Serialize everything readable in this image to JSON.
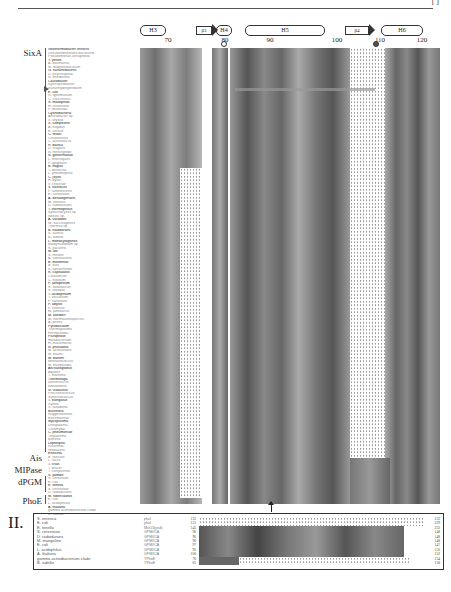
{
  "header": {
    "page_ref": "[ ]"
  },
  "secondary_structure": [
    {
      "type": "helix",
      "label": "H3"
    },
    {
      "type": "strand",
      "label": "β3"
    },
    {
      "type": "helix",
      "label": "H4"
    },
    {
      "type": "helix",
      "label": "H5"
    },
    {
      "type": "strand",
      "label": "β4"
    },
    {
      "type": "helix",
      "label": "H6"
    }
  ],
  "ruler": {
    "ticks": [
      "70",
      "80",
      "90",
      "100",
      "110",
      "120"
    ]
  },
  "groups": {
    "sixa": "SixA",
    "ais": "Ais",
    "mipase": "MIPase",
    "dpgm": "dPGM",
    "phoe": "PhoE"
  },
  "panel1": {
    "species": [
      "Geothermobacter ehrlichii",
      "Desulfovibrionales bacterium",
      "Pseudomonas aeruginosa",
      "Y. pestis",
      "A. baumannii",
      "M. magnetotacticum",
      "G. sulfurreducens",
      "D. psychrophila",
      "S. oneidensis",
      "Caulobacter",
      "Syntrophobacter",
      "Sulfurihydrogenibium",
      "E. coli",
      "S. typhimurium",
      "C. crescentus",
      "S. maltophilia",
      "H. influenzae",
      "P. multocida",
      "Cyanobacteria",
      "Arthrobacter sp.",
      "X. oryzae",
      "X. campestris",
      "A. fulgidus",
      "B. cereus",
      "C. tetani",
      "Chloroflexus",
      "C. aurantiacus",
      "R. baltica",
      "D. vulgaris",
      "N. meningitidis",
      "N. gonorrhoeae",
      "L. interrogans",
      "P. gingivalis",
      "B. fragilis",
      "T. denticola",
      "L. pneumophila",
      "C. jejuni",
      "H. pylori",
      "V. cholerae",
      "V. vulnificus",
      "P. luminescens",
      "E. carotovora",
      "A. dehalogenans",
      "M. xanthus",
      "D. radiodurans",
      "T. thermophilus",
      "Synechocystis sp.",
      "Nostoc sp.",
      "A. variabilis",
      "W. succinogenes",
      "Thermus sp.",
      "B. halodurans",
      "S. aureus",
      "B. subtilis",
      "L. monocytogenes",
      "Bradyrhizobium sp.",
      "R. palustris",
      "M. loti",
      "S. meliloti",
      "A. tumefaciens",
      "B. melitensis",
      "B. suis",
      "R. sphaeroides",
      "R. capsulatus",
      "Chlorobium",
      "C. tepidum",
      "P. aerophilum",
      "S. solfataricus",
      "S. tokodaii",
      "T. acidophilum",
      "T. volcanium",
      "P. horikoshii",
      "P. abyssi",
      "P. furiosus",
      "M. jannaschii",
      "M. kandleri",
      "M. thermautotrophicus",
      "A. pernix",
      "Pyrobaculum",
      "Thermoplasma",
      "Ferroplasma",
      "Picrophilus",
      "Halobacterium",
      "H. marismortui",
      "N. pharaonis",
      "M. acetivorans",
      "M. mazei",
      "M. barkeri",
      "Methanococcus",
      "M. maripaludis",
      "Archaeoglobus",
      "Aquifex",
      "T. maritima",
      "Thermotoga",
      "Deinococcus",
      "Bdellovibrio",
      "G. violaceus",
      "Prochlorococcus",
      "Synechococcus",
      "T. elongatus",
      "Xylella",
      "X. fastidiosa",
      "Buchnera",
      "Wigglesworthia",
      "Blochmannia",
      "Mycoplasma",
      "Ureaplasma",
      "Chlamydia",
      "C. pneumoniae",
      "Treponema",
      "Borrelia",
      "Leptospira",
      "Rickettsia",
      "Wolbachia",
      "Ehrlichia",
      "E. faecalis",
      "L. lactis",
      "T. cruzi",
      "T. brucei",
      "T. congolense",
      "S. pombe",
      "S. cerevisiae",
      "E. coli",
      "E. tenella",
      "S. cerevisiae",
      "D. radiodurans",
      "M. tuberculosis",
      "E. coli",
      "L. acidophilus",
      "A. thaliana",
      "gamma actinobacterium clade",
      "B. subtilis"
    ],
    "marker_row": "E. coli"
  },
  "panel2": {
    "label": "II.",
    "rows": [
      {
        "species": "S. enterica",
        "id": "phoI",
        "start": "132",
        "end": "232"
      },
      {
        "species": "E. coli",
        "id": "phoI",
        "start": "131",
        "end": "229"
      },
      {
        "species": "E. tenella",
        "id": "Mut13(ped)",
        "start": "145",
        "end": "252"
      },
      {
        "species": "S. cerevisiae",
        "id": "GPM/ICA",
        "start": "96",
        "end": "148"
      },
      {
        "species": "D. radiodurans",
        "id": "GPM/ICA",
        "start": "96",
        "end": "148"
      },
      {
        "species": "M. mangeline",
        "id": "GPM/ICA",
        "start": "96",
        "end": "148"
      },
      {
        "species": "E. coli",
        "id": "GPM/ICA",
        "start": "97",
        "end": "147"
      },
      {
        "species": "L. acidophilus",
        "id": "GPM/ICA",
        "start": "95",
        "end": "150"
      },
      {
        "species": "A. thaliana",
        "id": "GPM/ICA",
        "start": "100",
        "end": "152"
      },
      {
        "species": "gamma actinobacterium clade",
        "id": "YPhoE",
        "start": "76",
        "end": "154"
      },
      {
        "species": "B. subtilis",
        "id": "YPhoE",
        "start": "81",
        "end": "158"
      }
    ]
  }
}
